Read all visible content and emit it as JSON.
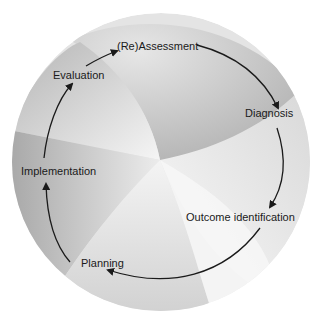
{
  "diagram": {
    "type": "cycle",
    "steps": [
      {
        "label": "(Re)Assessment"
      },
      {
        "label": "Diagnosis"
      },
      {
        "label": "Outcome identification"
      },
      {
        "label": "Planning"
      },
      {
        "label": "Implementation"
      },
      {
        "label": "Evaluation"
      }
    ],
    "colors": {
      "background": "#ffffff",
      "arrow": "#1a1a1a",
      "shade_dark": "#a9a9a9",
      "shade_light": "#f2f2f2"
    }
  }
}
